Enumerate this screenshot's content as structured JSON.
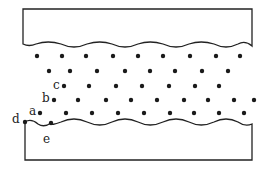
{
  "diagram": {
    "colors": {
      "line": "#222222",
      "dot": "#1a1a1a",
      "background": "#ffffff"
    },
    "labels": [
      {
        "id": "a",
        "text": "a",
        "x": 29,
        "y": 115
      },
      {
        "id": "b",
        "text": "b",
        "x": 42,
        "y": 102
      },
      {
        "id": "c",
        "text": "c",
        "x": 53,
        "y": 89
      },
      {
        "id": "d",
        "text": "d",
        "x": 12,
        "y": 123
      },
      {
        "id": "e",
        "text": "e",
        "x": 43,
        "y": 143
      }
    ],
    "particle_rows": [
      {
        "y": 56,
        "xs": [
          37,
          62,
          86,
          113,
          138,
          163,
          190,
          216,
          240
        ]
      },
      {
        "y": 71,
        "xs": [
          49,
          70,
          97,
          125,
          150,
          175,
          202,
          228
        ]
      },
      {
        "y": 86,
        "xs": [
          64,
          89,
          116,
          142,
          169,
          195,
          219
        ]
      },
      {
        "y": 100,
        "xs": [
          54,
          78,
          106,
          131,
          157,
          184,
          208,
          234,
          254
        ]
      },
      {
        "y": 113,
        "xs": [
          40,
          66,
          92,
          118,
          144,
          170,
          194,
          219,
          244
        ]
      }
    ],
    "special_points": [
      {
        "id": "d",
        "x": 25,
        "y": 122
      },
      {
        "id": "e",
        "x": 51,
        "y": 123
      }
    ]
  }
}
